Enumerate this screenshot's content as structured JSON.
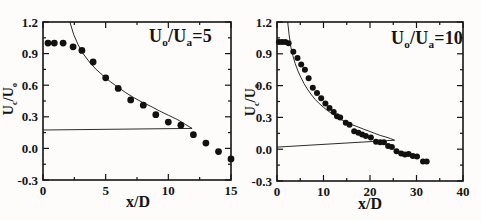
{
  "figure": {
    "background": "#fdfcfa",
    "ink": "#141414"
  },
  "chart_data": [
    {
      "type": "scatter",
      "title": "Uo/Ua=5",
      "title_segments": [
        {
          "text": "U"
        },
        {
          "text": "o",
          "sub": true
        },
        {
          "text": "/U"
        },
        {
          "text": "a",
          "sub": true
        },
        {
          "text": "=5"
        }
      ],
      "xlabel": "x/D",
      "ylabel": "Uc/Uo",
      "ylabel_segments": [
        {
          "text": "U"
        },
        {
          "text": "c",
          "sub": true
        },
        {
          "text": "/U"
        },
        {
          "text": "o",
          "sub": true
        }
      ],
      "xlim": [
        0,
        15
      ],
      "ylim": [
        -0.3,
        1.2
      ],
      "grid": false,
      "legend": "none",
      "xticks": {
        "values": [
          0,
          5,
          10,
          15
        ],
        "labels": [
          "0",
          "5",
          "10",
          "15"
        ]
      },
      "yticks": {
        "values": [
          -0.3,
          0.0,
          0.3,
          0.6,
          0.9,
          1.2
        ],
        "labels": [
          "-0.3",
          "0.0",
          "0.3",
          "0.6",
          "0.9",
          "1.2"
        ]
      },
      "xminor": [
        2.5,
        7.5,
        12.5
      ],
      "yminor": [
        -0.15,
        0.15,
        0.45,
        0.75,
        1.05
      ],
      "marker": {
        "shape": "filled-circle",
        "color": "#111111",
        "radius": 3.4
      },
      "points": [
        [
          0.4,
          1.0
        ],
        [
          0.9,
          1.0
        ],
        [
          1.6,
          1.0
        ],
        [
          2.4,
          0.965
        ],
        [
          3.1,
          0.93
        ],
        [
          4.0,
          0.82
        ],
        [
          5.0,
          0.67
        ],
        [
          6.0,
          0.57
        ],
        [
          7.0,
          0.46
        ],
        [
          8.0,
          0.41
        ],
        [
          9.0,
          0.32
        ],
        [
          10.0,
          0.25
        ],
        [
          11.0,
          0.22
        ],
        [
          12.0,
          0.13
        ],
        [
          13.0,
          0.05
        ],
        [
          14.0,
          -0.03
        ],
        [
          15.0,
          -0.1
        ]
      ],
      "curves": [
        {
          "name": "model-curve",
          "points": [
            [
              2.15,
              1.2
            ],
            [
              2.45,
              1.08
            ],
            [
              2.8,
              0.985
            ],
            [
              3.2,
              0.9
            ],
            [
              3.7,
              0.82
            ],
            [
              4.2,
              0.755
            ],
            [
              4.8,
              0.69
            ],
            [
              5.4,
              0.63
            ],
            [
              6.0,
              0.58
            ],
            [
              6.6,
              0.53
            ],
            [
              7.2,
              0.485
            ],
            [
              7.9,
              0.44
            ],
            [
              8.6,
              0.4
            ],
            [
              9.3,
              0.355
            ],
            [
              10.0,
              0.315
            ],
            [
              10.7,
              0.275
            ],
            [
              11.4,
              0.225
            ],
            [
              11.9,
              0.19
            ]
          ]
        },
        {
          "name": "closure-line",
          "points": [
            [
              0,
              0.175
            ],
            [
              11.9,
              0.19
            ]
          ]
        }
      ]
    },
    {
      "type": "scatter",
      "title": "Uo/Ua=10",
      "title_segments": [
        {
          "text": "U"
        },
        {
          "text": "o",
          "sub": true
        },
        {
          "text": "/U"
        },
        {
          "text": "a",
          "sub": true
        },
        {
          "text": "=10"
        }
      ],
      "xlabel": "x/D",
      "ylabel": "Uc/Uo",
      "ylabel_segments": [
        {
          "text": "U"
        },
        {
          "text": "c",
          "sub": true
        },
        {
          "text": "/U"
        },
        {
          "text": "o",
          "sub": true
        }
      ],
      "xlim": [
        0,
        40
      ],
      "ylim": [
        -0.3,
        1.2
      ],
      "grid": false,
      "legend": "none",
      "xticks": {
        "values": [
          0,
          10,
          20,
          30,
          40
        ],
        "labels": [
          "0",
          "10",
          "20",
          "30",
          "40"
        ]
      },
      "yticks": {
        "values": [
          -0.3,
          0.0,
          0.3,
          0.6,
          0.9,
          1.2
        ],
        "labels": [
          "-0.3",
          "0.0",
          "0.3",
          "0.6",
          "0.9",
          "1.2"
        ]
      },
      "xminor": [
        5,
        15,
        25,
        35
      ],
      "yminor": [
        -0.15,
        0.15,
        0.45,
        0.75,
        1.05
      ],
      "marker": {
        "shape": "filled-circle",
        "color": "#111111",
        "radius": 3.0
      },
      "points": [
        [
          0.4,
          1.01
        ],
        [
          1.1,
          1.01
        ],
        [
          1.8,
          1.01
        ],
        [
          2.5,
          1.0
        ],
        [
          3.5,
          0.92
        ],
        [
          4.4,
          0.86
        ],
        [
          5.2,
          0.8
        ],
        [
          6.0,
          0.75
        ],
        [
          6.8,
          0.67
        ],
        [
          7.7,
          0.58
        ],
        [
          8.6,
          0.53
        ],
        [
          9.5,
          0.48
        ],
        [
          10.4,
          0.43
        ],
        [
          11.3,
          0.39
        ],
        [
          12.2,
          0.35
        ],
        [
          12.9,
          0.31
        ],
        [
          13.6,
          0.3
        ],
        [
          14.8,
          0.25
        ],
        [
          15.6,
          0.23
        ],
        [
          16.6,
          0.17
        ],
        [
          17.5,
          0.155
        ],
        [
          18.3,
          0.14
        ],
        [
          19.1,
          0.125
        ],
        [
          20.2,
          0.11
        ],
        [
          21.3,
          0.07
        ],
        [
          22.2,
          0.065
        ],
        [
          23.0,
          0.065
        ],
        [
          23.9,
          0.03
        ],
        [
          24.7,
          0.02
        ],
        [
          25.7,
          -0.02
        ],
        [
          26.7,
          -0.04
        ],
        [
          27.5,
          -0.05
        ],
        [
          28.3,
          -0.045
        ],
        [
          29.2,
          -0.065
        ],
        [
          30.1,
          -0.07
        ],
        [
          31.4,
          -0.115
        ],
        [
          32.2,
          -0.115
        ]
      ],
      "curves": [
        {
          "name": "model-curve",
          "points": [
            [
              2.3,
              1.2
            ],
            [
              2.6,
              1.08
            ],
            [
              3.0,
              0.96
            ],
            [
              3.4,
              0.885
            ],
            [
              3.9,
              0.81
            ],
            [
              4.5,
              0.74
            ],
            [
              5.1,
              0.68
            ],
            [
              5.8,
              0.62
            ],
            [
              6.5,
              0.57
            ],
            [
              7.3,
              0.52
            ],
            [
              8.2,
              0.47
            ],
            [
              9.1,
              0.43
            ],
            [
              10.0,
              0.395
            ],
            [
              11.0,
              0.36
            ],
            [
              12.0,
              0.33
            ],
            [
              13.0,
              0.3
            ],
            [
              14.0,
              0.275
            ],
            [
              15.0,
              0.255
            ],
            [
              16.2,
              0.23
            ],
            [
              17.4,
              0.21
            ],
            [
              18.6,
              0.19
            ],
            [
              19.8,
              0.17
            ],
            [
              21.0,
              0.15
            ],
            [
              22.2,
              0.13
            ],
            [
              23.4,
              0.115
            ],
            [
              24.4,
              0.1
            ],
            [
              25.3,
              0.085
            ]
          ]
        },
        {
          "name": "closure-line",
          "points": [
            [
              0,
              0.02
            ],
            [
              25.3,
              0.085
            ]
          ]
        }
      ]
    }
  ]
}
